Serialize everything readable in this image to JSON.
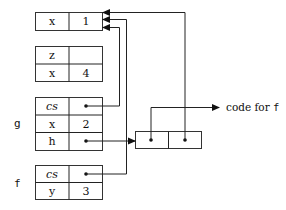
{
  "diagram": {
    "type": "environment-frames",
    "frames": [
      {
        "id": "global",
        "label": "",
        "rows": [
          {
            "name": "x",
            "value": "1"
          }
        ]
      },
      {
        "id": "frame2",
        "label": "",
        "rows": [
          {
            "name": "z",
            "value": ""
          },
          {
            "name": "x",
            "value": "4"
          }
        ]
      },
      {
        "id": "g",
        "label": "g",
        "rows": [
          {
            "name": "cs",
            "value": "•",
            "italic": true
          },
          {
            "name": "x",
            "value": "2"
          },
          {
            "name": "h",
            "value": "•"
          }
        ]
      },
      {
        "id": "f",
        "label": "f",
        "rows": [
          {
            "name": "cs",
            "value": "•",
            "italic": true
          },
          {
            "name": "y",
            "value": "3"
          }
        ]
      }
    ],
    "closure": {
      "cells": [
        "•",
        "•"
      ],
      "code_label": "code for",
      "code_name": "f"
    },
    "arrows": [
      {
        "from": "g.cs",
        "to": "global"
      },
      {
        "from": "f.cs",
        "to": "global"
      },
      {
        "from": "g.h",
        "to": "closure"
      },
      {
        "from": "closure.code",
        "to": "code for f"
      },
      {
        "from": "closure.env",
        "to": "global"
      }
    ]
  }
}
